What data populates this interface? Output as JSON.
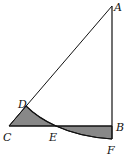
{
  "diagram": {
    "type": "geometry",
    "colors": {
      "stroke": "#111111",
      "shade": "#888888",
      "background": "#ffffff"
    },
    "points": {
      "A": {
        "label": "A",
        "x": 112,
        "y": 6
      },
      "B": {
        "label": "B",
        "x": 112,
        "y": 126
      },
      "C": {
        "label": "C",
        "x": 9,
        "y": 126
      },
      "D": {
        "label": "D",
        "x": 26,
        "y": 106
      },
      "E": {
        "label": "E",
        "x": 56,
        "y": 126
      },
      "F": {
        "label": "F",
        "x": 112,
        "y": 139
      }
    },
    "segments": [
      "AC",
      "AB",
      "CB",
      "BF"
    ],
    "arcs": [
      {
        "name": "arc-DEF",
        "center": "A",
        "from": "D",
        "to": "F"
      }
    ],
    "shaded_regions": [
      "CDE",
      "EBF"
    ]
  }
}
